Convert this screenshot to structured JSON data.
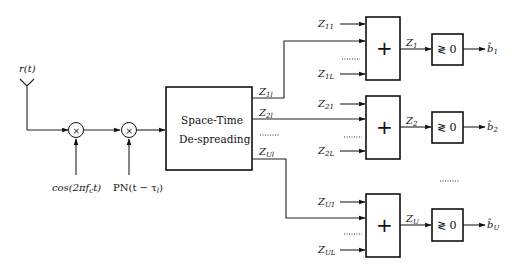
{
  "diagram": {
    "input": {
      "antenna_label": "r(t)"
    },
    "mixers": [
      {
        "symbol": "×",
        "ref_label": "cos(2πf",
        "ref_sub": "c",
        "ref_tail": "t)"
      },
      {
        "symbol": "×",
        "ref_label": "PN(t − τ",
        "ref_sub": "l",
        "ref_tail": ")"
      }
    ],
    "despreader": {
      "line1": "Space-Time",
      "line2": "De-spreading"
    },
    "despreader_outputs": [
      {
        "z": "Z",
        "sub": "1l"
      },
      {
        "z": "Z",
        "sub": "2l"
      },
      {
        "dots": "……"
      },
      {
        "z": "Z",
        "sub": "Ul"
      }
    ],
    "branches": [
      {
        "inputs": [
          {
            "z": "Z",
            "sub": "11"
          },
          {
            "z": "Z",
            "sub": "1L"
          }
        ],
        "sum_symbol": "+",
        "output": {
          "z": "Z",
          "sub": "1"
        },
        "decision": "≷ 0",
        "decision_out": {
          "b": "b̂",
          "sub": "1"
        }
      },
      {
        "inputs": [
          {
            "z": "Z",
            "sub": "21"
          },
          {
            "z": "Z",
            "sub": "2L"
          }
        ],
        "sum_symbol": "+",
        "output": {
          "z": "Z",
          "sub": "2"
        },
        "decision": "≷ 0",
        "decision_out": {
          "b": "b̂",
          "sub": "2"
        }
      },
      {
        "inputs": [
          {
            "z": "Z",
            "sub": "U1"
          },
          {
            "z": "Z",
            "sub": "UL"
          }
        ],
        "sum_symbol": "+",
        "output": {
          "z": "Z",
          "sub": "U"
        },
        "decision": "≷ 0",
        "decision_out": {
          "b": "b̂",
          "sub": "U"
        }
      }
    ],
    "ellipsis": "……"
  }
}
